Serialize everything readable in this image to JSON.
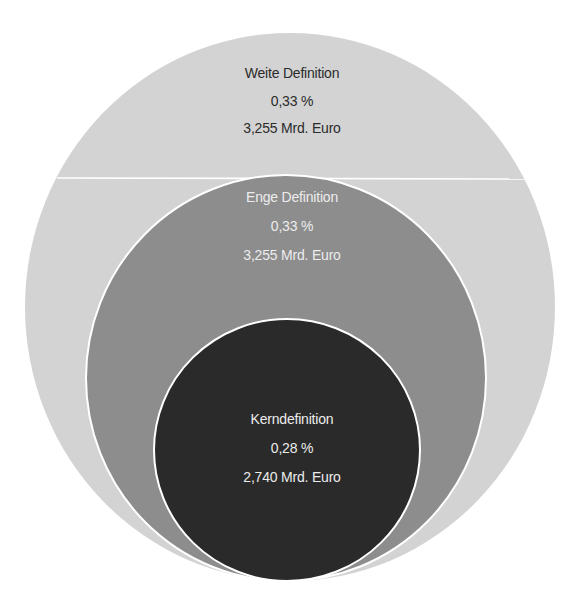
{
  "diagram": {
    "type": "nested-circles",
    "colors": {
      "background": "#ffffff",
      "outer_fill": "#d3d3d3",
      "middle_fill": "#8d8d8d",
      "inner_fill": "#2a2a2a",
      "separator": "#ffffff",
      "outer_text": "#2b2b2b",
      "inner_text": "#ececec"
    },
    "circles": [
      {
        "id": "weite",
        "title": "Weite Definition",
        "percent": "0,33 %",
        "amount": "3,255 Mrd. Euro"
      },
      {
        "id": "enge",
        "title": "Enge Definition",
        "percent": "0,33 %",
        "amount": "3,255 Mrd. Euro"
      },
      {
        "id": "kern",
        "title": "Kerndefinition",
        "percent": "0,28 %",
        "amount": "2,740 Mrd. Euro"
      }
    ]
  }
}
